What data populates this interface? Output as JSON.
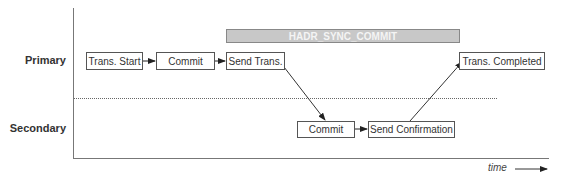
{
  "diagram": {
    "rows": {
      "primary": "Primary",
      "secondary": "Secondary"
    },
    "phase_bar": {
      "label": "HADR_SYNC_COMMIT",
      "color": "#c8c8c8"
    },
    "primary_steps": [
      {
        "label": "Trans. Start"
      },
      {
        "label": "Commit"
      },
      {
        "label": "Send Trans."
      },
      {
        "label": "Trans. Completed"
      }
    ],
    "secondary_steps": [
      {
        "label": "Commit"
      },
      {
        "label": "Send Confirmation"
      }
    ],
    "axis": {
      "x_label": "time"
    },
    "colors": {
      "line": "#555555",
      "text": "#333333"
    }
  }
}
